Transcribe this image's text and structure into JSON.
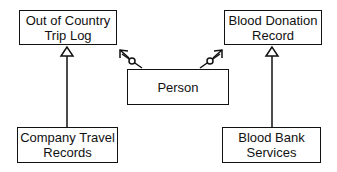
{
  "diagram": {
    "boxes": {
      "trip_log": {
        "line1": "Out of Country",
        "line2": "Trip Log"
      },
      "blood_donation": {
        "line1": "Blood Donation",
        "line2": "Record"
      },
      "person": {
        "line1": "Person"
      },
      "company_travel": {
        "line1": "Company Travel",
        "line2": "Records"
      },
      "blood_bank": {
        "line1": "Blood Bank",
        "line2": "Services"
      }
    },
    "connections": [
      {
        "from": "Company Travel Records",
        "to": "Out of Country Trip Log",
        "type": "generalization"
      },
      {
        "from": "Blood Bank Services",
        "to": "Blood Donation Record",
        "type": "generalization"
      },
      {
        "from": "Person",
        "to": "Out of Country Trip Log",
        "type": "navigable-association"
      },
      {
        "from": "Person",
        "to": "Blood Donation Record",
        "type": "navigable-association"
      }
    ]
  }
}
